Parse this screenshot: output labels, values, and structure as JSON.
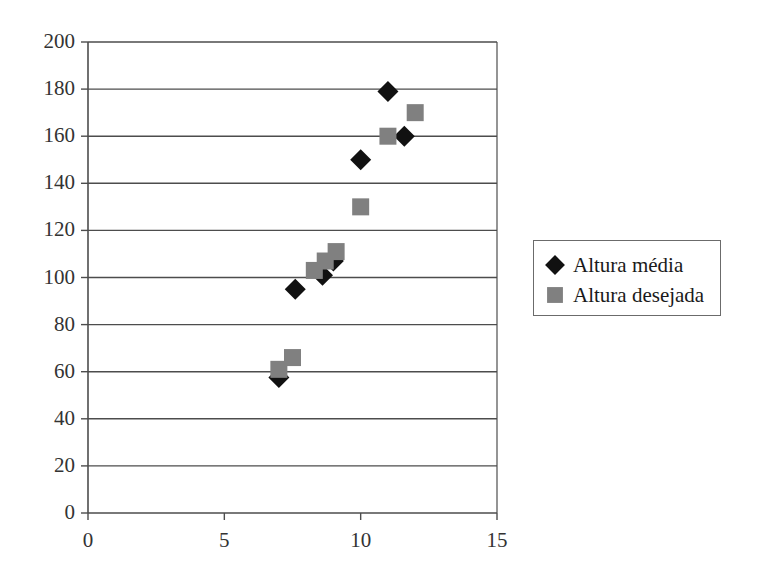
{
  "chart_data": {
    "type": "scatter",
    "title": "",
    "xlabel": "",
    "ylabel": "",
    "xlim": [
      0,
      15
    ],
    "ylim": [
      0,
      200
    ],
    "xticks": [
      0,
      5,
      10,
      15
    ],
    "yticks": [
      0,
      20,
      40,
      60,
      80,
      100,
      120,
      140,
      160,
      180,
      200
    ],
    "xtick_labels": [
      "0",
      "5",
      "10",
      "15"
    ],
    "ytick_labels": [
      "0",
      "20",
      "40",
      "60",
      "80",
      "100",
      "120",
      "140",
      "160",
      "180",
      "200"
    ],
    "grid": "horizontal",
    "legend_position": "right",
    "series": [
      {
        "name": "Altura média",
        "marker": "diamond",
        "color": "#111111",
        "points": [
          {
            "x": 7.0,
            "y": 57.5
          },
          {
            "x": 7.6,
            "y": 95
          },
          {
            "x": 8.6,
            "y": 101
          },
          {
            "x": 9.0,
            "y": 107
          },
          {
            "x": 10.0,
            "y": 150
          },
          {
            "x": 11.0,
            "y": 179
          },
          {
            "x": 11.6,
            "y": 160
          }
        ]
      },
      {
        "name": "Altura desejada",
        "marker": "square",
        "color": "#808080",
        "points": [
          {
            "x": 7.0,
            "y": 61
          },
          {
            "x": 7.5,
            "y": 66
          },
          {
            "x": 8.3,
            "y": 103
          },
          {
            "x": 8.7,
            "y": 107
          },
          {
            "x": 9.1,
            "y": 111
          },
          {
            "x": 10.0,
            "y": 130
          },
          {
            "x": 11.0,
            "y": 160
          },
          {
            "x": 12.0,
            "y": 170
          }
        ]
      }
    ]
  },
  "legend": {
    "entries": [
      {
        "label": "Altura média",
        "marker": "diamond",
        "color": "#111111"
      },
      {
        "label": "Altura desejada",
        "marker": "square",
        "color": "#808080"
      }
    ]
  },
  "axes": {
    "frame_color": "#4d4d4d",
    "gridline_color": "#4d4d4d",
    "background": "#ffffff"
  }
}
